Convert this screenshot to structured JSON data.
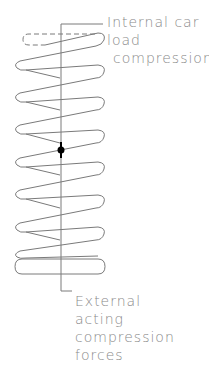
{
  "diagram": {
    "colors": {
      "line": "#7a7a7a",
      "text": "#8a8a8a",
      "dot": "#000000",
      "background": "#ffffff"
    },
    "labels": {
      "top": {
        "line1": "Internal car",
        "line2": "load",
        "line3": "compression"
      },
      "bottom": {
        "line1": "External",
        "line2": "acting",
        "line3": "compression",
        "line4": "forces"
      }
    },
    "components": {
      "spring": "coil-spring",
      "ghost_top_coil": "dashed-outline",
      "center_axis": "leader-line",
      "center_marker": "force-point-dot"
    }
  }
}
